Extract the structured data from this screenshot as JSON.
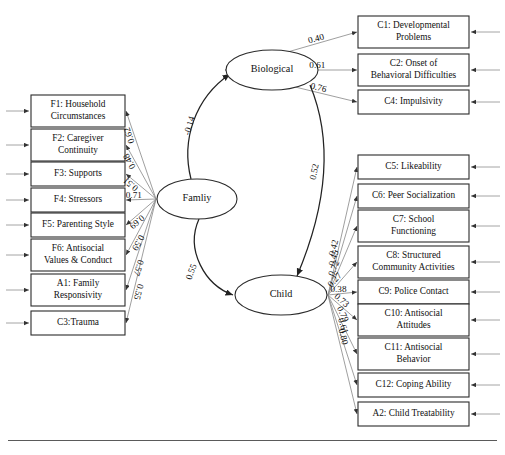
{
  "figure": {
    "type": "sem-path-diagram",
    "title": "",
    "background_color": "#ffffff",
    "line_color": "#2b2b2b",
    "loading_line_color": "#8e8e8e"
  },
  "latent_variables": [
    {
      "id": "biological",
      "label": "Biological",
      "cx": 272,
      "cy": 70,
      "rx": 46,
      "ry": 20
    },
    {
      "id": "family",
      "label": "Famliy",
      "cx": 197,
      "cy": 199,
      "rx": 40,
      "ry": 20
    },
    {
      "id": "child",
      "label": "Child",
      "cx": 281,
      "cy": 295,
      "rx": 46,
      "ry": 20
    }
  ],
  "family_indicators": [
    {
      "code": "F1",
      "label": "F1: Household\nCircumstances",
      "loading": "0.62",
      "y": 111
    },
    {
      "code": "F2",
      "label": "F2: Caregiver\nContinuity",
      "loading": "0.48",
      "y": 145
    },
    {
      "code": "F3",
      "label": "F3: Supports",
      "loading": "0.51",
      "y": 174
    },
    {
      "code": "F4",
      "label": "F4: Stressors",
      "loading": "0.71",
      "y": 200
    },
    {
      "code": "F5",
      "label": "F5: Parenting Style",
      "loading": "0.69",
      "y": 225
    },
    {
      "code": "F6",
      "label": "F6: Antisocial\nValues & Conduct",
      "loading": "0.59",
      "y": 255
    },
    {
      "code": "A1",
      "label": "A1: Family\nResponsivity",
      "loading": "0.57",
      "y": 290
    },
    {
      "code": "C3",
      "label": "C3:Trauma",
      "loading": "0.55",
      "y": 323
    }
  ],
  "biological_indicators": [
    {
      "code": "C1",
      "label": "C1: Developmental\nProblems",
      "loading": "0.40",
      "y": 32
    },
    {
      "code": "C2",
      "label": "C2: Onset of\nBehavioral Difficulties",
      "loading": "0.61",
      "y": 70
    },
    {
      "code": "C4",
      "label": "C4: Impulsivity",
      "loading": "0.76",
      "y": 102
    }
  ],
  "child_indicators": [
    {
      "code": "C5",
      "label": "C5: Likeability",
      "loading": "0.42",
      "y": 167
    },
    {
      "code": "C6",
      "label": "C6: Peer Socialization",
      "loading": "0.45",
      "y": 196
    },
    {
      "code": "C7",
      "label": "C7: School\nFunctioning",
      "loading": "0.72",
      "y": 226
    },
    {
      "code": "C8",
      "label": "C8: Structured\nCommunity Activities",
      "loading": "0.27",
      "y": 262
    },
    {
      "code": "C9",
      "label": "C9: Police Contact",
      "loading": "0.38",
      "y": 292
    },
    {
      "code": "C10",
      "label": "C10: Antisocial\nAttitudes",
      "loading": "0.73",
      "y": 320
    },
    {
      "code": "C11",
      "label": "C11: Antisocial\nBehavior",
      "loading": "0.79",
      "y": 354
    },
    {
      "code": "C12",
      "label": "C12: Coping Ability",
      "loading": "0.61",
      "y": 385
    },
    {
      "code": "A2",
      "label": "A2: Child Treatability",
      "loading": "0.80",
      "y": 414
    }
  ],
  "structural_paths": [
    {
      "id": "family-to-biological",
      "from": "Famliy",
      "to": "Biological",
      "coefficient": "-0.14"
    },
    {
      "id": "biological-to-child",
      "from": "Biological",
      "to": "Child",
      "coefficient": "0.52"
    },
    {
      "id": "family-to-child",
      "from": "Famliy",
      "to": "Child",
      "coefficient": "0.55"
    }
  ],
  "chart_data": {
    "type": "diagram",
    "latents": [
      "Biological",
      "Famliy",
      "Child"
    ],
    "loadings": {
      "Famliy": {
        "F1: Household Circumstances": 0.62,
        "F2: Caregiver Continuity": 0.48,
        "F3: Supports": 0.51,
        "F4: Stressors": 0.71,
        "F5: Parenting Style": 0.69,
        "F6: Antisocial Values & Conduct": 0.59,
        "A1: Family Responsivity": 0.57,
        "C3:Trauma": 0.55
      },
      "Biological": {
        "C1: Developmental Problems": 0.4,
        "C2: Onset of Behavioral Difficulties": 0.61,
        "C4: Impulsivity": 0.76
      },
      "Child": {
        "C5: Likeability": 0.42,
        "C6: Peer Socialization": 0.45,
        "C7: School Functioning": 0.72,
        "C8: Structured Community Activities": 0.27,
        "C9: Police Contact": 0.38,
        "C10: Antisocial Attitudes": 0.73,
        "C11: Antisocial Behavior": 0.79,
        "C12: Coping Ability": 0.61,
        "A2: Child Treatability": 0.8
      }
    },
    "paths": {
      "Famliy -> Biological": -0.14,
      "Biological -> Child": 0.52,
      "Famliy -> Child": 0.55
    }
  }
}
